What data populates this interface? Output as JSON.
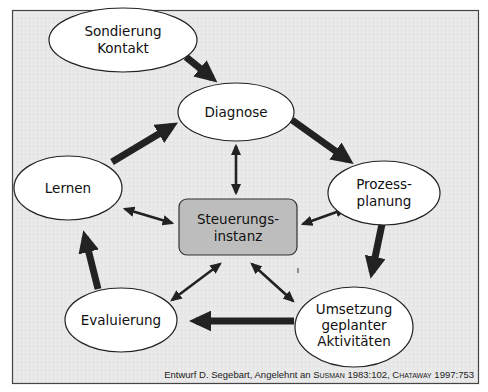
{
  "diagram": {
    "type": "process-cycle",
    "colors": {
      "background": "#e9e9e9",
      "frame": "#444444",
      "node_fill": "#ffffff",
      "node_stroke": "#222222",
      "center_fill": "#bdbdbd",
      "arrow": "#222222"
    },
    "nodes": {
      "sondierung": {
        "line1": "Sondierung",
        "line2": "Kontakt"
      },
      "diagnose": {
        "line1": "Diagnose"
      },
      "prozessplanung": {
        "line1": "Prozess-",
        "line2": "planung"
      },
      "lernen": {
        "line1": "Lernen"
      },
      "steuerung": {
        "line1": "Steuerungs-",
        "line2": "instanz"
      },
      "evaluierung": {
        "line1": "Evaluierung"
      },
      "umsetzung": {
        "line1": "Umsetzung",
        "line2": "geplanter",
        "line3": "Aktivitäten"
      }
    },
    "edges": [
      {
        "from": "Sondierung Kontakt",
        "to": "Diagnose",
        "style": "thick"
      },
      {
        "from": "Diagnose",
        "to": "Prozessplanung",
        "style": "thick"
      },
      {
        "from": "Prozessplanung",
        "to": "Umsetzung geplanter Aktivitäten",
        "style": "thick"
      },
      {
        "from": "Umsetzung geplanter Aktivitäten",
        "to": "Evaluierung",
        "style": "thick"
      },
      {
        "from": "Evaluierung",
        "to": "Lernen",
        "style": "thick"
      },
      {
        "from": "Lernen",
        "to": "Diagnose",
        "style": "thick"
      },
      {
        "from": "Steuerungsinstanz",
        "to": "Diagnose",
        "style": "thin-bidirectional"
      },
      {
        "from": "Steuerungsinstanz",
        "to": "Lernen",
        "style": "thin-bidirectional"
      },
      {
        "from": "Steuerungsinstanz",
        "to": "Prozessplanung",
        "style": "thin-bidirectional"
      },
      {
        "from": "Steuerungsinstanz",
        "to": "Evaluierung",
        "style": "thin-bidirectional"
      },
      {
        "from": "Steuerungsinstanz",
        "to": "Umsetzung geplanter Aktivitäten",
        "style": "thin-bidirectional"
      }
    ],
    "caption": {
      "prefix": "Entwurf D. Segebart, Angelehnt an ",
      "author1": "Susman",
      "ref1": " 1983:102, ",
      "author2": "Chataway",
      "ref2": " 1997:753"
    }
  }
}
